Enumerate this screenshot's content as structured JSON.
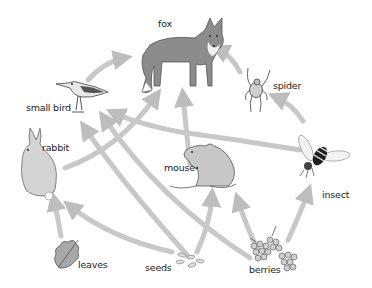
{
  "organisms": {
    "fox": {
      "label": "fox",
      "role": "top predator"
    },
    "spider": {
      "label": "spider",
      "role": "predator"
    },
    "small_bird": {
      "label": "small bird",
      "role": "consumer"
    },
    "rabbit": {
      "label": "rabbit",
      "role": "herbivore"
    },
    "mouse": {
      "label": "mouse",
      "role": "consumer"
    },
    "insect": {
      "label": "insect",
      "role": "consumer"
    },
    "leaves": {
      "label": "leaves",
      "role": "producer"
    },
    "seeds": {
      "label": "seeds",
      "role": "producer"
    },
    "berries": {
      "label": "berries",
      "role": "producer"
    }
  },
  "arrows": [
    {
      "from": "small bird",
      "to": "fox"
    },
    {
      "from": "rabbit",
      "to": "fox"
    },
    {
      "from": "mouse",
      "to": "fox"
    },
    {
      "from": "spider",
      "to": "fox"
    },
    {
      "from": "insect",
      "to": "spider"
    },
    {
      "from": "insect",
      "to": "small bird"
    },
    {
      "from": "seeds",
      "to": "small bird"
    },
    {
      "from": "berries",
      "to": "small bird"
    },
    {
      "from": "leaves",
      "to": "rabbit"
    },
    {
      "from": "seeds",
      "to": "rabbit"
    },
    {
      "from": "seeds",
      "to": "mouse"
    },
    {
      "from": "berries",
      "to": "mouse"
    },
    {
      "from": "berries",
      "to": "insect"
    }
  ],
  "colors": {
    "arrow": "#c4c4c4",
    "fox_body": "#8a8a8a",
    "rabbit_body": "#d2d2d2",
    "mouse_body": "#c8c8c8",
    "text": "#222222"
  }
}
